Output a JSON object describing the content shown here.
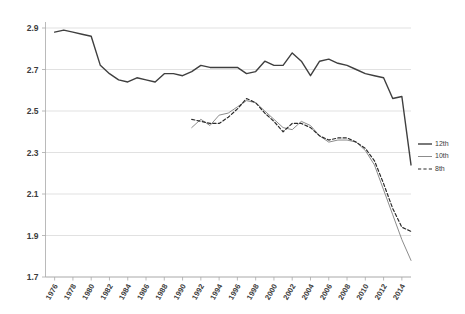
{
  "chart_data": {
    "type": "line",
    "title": "",
    "subtitle": "",
    "xlabel": "",
    "ylabel": "",
    "xlim": [
      1975,
      2015
    ],
    "ylim": [
      1.7,
      2.9
    ],
    "yticks": [
      "1.7",
      "1.9",
      "2.1",
      "2.3",
      "2.5",
      "2.7",
      "2.9"
    ],
    "ytick_values": [
      1.7,
      1.9,
      2.1,
      2.3,
      2.5,
      2.7,
      2.9
    ],
    "xticks": [
      "1976",
      "1978",
      "1980",
      "1982",
      "1984",
      "1986",
      "1988",
      "1990",
      "1992",
      "1994",
      "1996",
      "1998",
      "2000",
      "2002",
      "2004",
      "2006",
      "2008",
      "2010",
      "2012",
      "2014"
    ],
    "xtick_values": [
      1976,
      1978,
      1980,
      1982,
      1984,
      1986,
      1988,
      1990,
      1992,
      1994,
      1996,
      1998,
      2000,
      2002,
      2004,
      2006,
      2008,
      2010,
      2012,
      2014
    ],
    "grid": true,
    "grid_axis": "y",
    "legend_position": "right",
    "series": [
      {
        "name": "12th",
        "style": "solid",
        "color": "#3f3f3f",
        "width": 1.4,
        "x": [
          1976,
          1977,
          1978,
          1979,
          1980,
          1981,
          1982,
          1983,
          1984,
          1985,
          1986,
          1987,
          1988,
          1989,
          1990,
          1991,
          1992,
          1993,
          1994,
          1995,
          1996,
          1997,
          1998,
          1999,
          2000,
          2001,
          2002,
          2003,
          2004,
          2005,
          2006,
          2007,
          2008,
          2009,
          2010,
          2011,
          2012,
          2013,
          2014,
          2015
        ],
        "values": [
          2.88,
          2.89,
          2.88,
          2.87,
          2.86,
          2.72,
          2.68,
          2.65,
          2.64,
          2.66,
          2.65,
          2.64,
          2.68,
          2.68,
          2.67,
          2.69,
          2.72,
          2.71,
          2.71,
          2.71,
          2.71,
          2.68,
          2.69,
          2.74,
          2.72,
          2.72,
          2.78,
          2.74,
          2.67,
          2.74,
          2.75,
          2.73,
          2.72,
          2.7,
          2.68,
          2.67,
          2.66,
          2.56,
          2.57,
          2.24
        ]
      },
      {
        "name": "10th",
        "style": "solid",
        "color": "#8c8c8c",
        "width": 1.0,
        "x": [
          1991,
          1992,
          1993,
          1994,
          1995,
          1996,
          1997,
          1998,
          1999,
          2000,
          2001,
          2002,
          2003,
          2004,
          2005,
          2006,
          2007,
          2008,
          2009,
          2010,
          2011,
          2012,
          2013,
          2014,
          2015
        ],
        "values": [
          2.42,
          2.46,
          2.43,
          2.48,
          2.49,
          2.52,
          2.55,
          2.54,
          2.5,
          2.46,
          2.42,
          2.41,
          2.45,
          2.43,
          2.38,
          2.35,
          2.36,
          2.36,
          2.35,
          2.31,
          2.24,
          2.12,
          2.0,
          1.88,
          1.78
        ]
      },
      {
        "name": "8th",
        "style": "dashed",
        "color": "#2b2b2b",
        "width": 1.2,
        "x": [
          1991,
          1992,
          1993,
          1994,
          1995,
          1996,
          1997,
          1998,
          1999,
          2000,
          2001,
          2002,
          2003,
          2004,
          2005,
          2006,
          2007,
          2008,
          2009,
          2010,
          2011,
          2012,
          2013,
          2014,
          2015
        ],
        "values": [
          2.46,
          2.45,
          2.44,
          2.44,
          2.47,
          2.51,
          2.56,
          2.54,
          2.49,
          2.45,
          2.4,
          2.44,
          2.44,
          2.42,
          2.38,
          2.36,
          2.37,
          2.37,
          2.35,
          2.32,
          2.26,
          2.15,
          2.03,
          1.94,
          1.92
        ]
      }
    ]
  },
  "legend": {
    "items": [
      {
        "label": "12th"
      },
      {
        "label": "10th"
      },
      {
        "label": "8th"
      }
    ]
  }
}
